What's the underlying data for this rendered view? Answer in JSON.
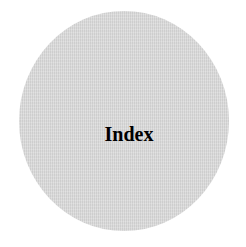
{
  "badge": {
    "label": "Index",
    "fill_color": "#d8d8d8",
    "text_color": "#000000",
    "shape": "circle"
  }
}
